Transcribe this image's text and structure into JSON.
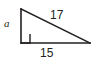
{
  "figure": {
    "type": "right-triangle-diagram",
    "background_color": "#ffffff",
    "stroke_color": "#231f20",
    "labels": {
      "leg_vertical": "a",
      "hypotenuse": "17",
      "base_horizontal": "15"
    },
    "geometry": {
      "apex_top": [
        21,
        9
      ],
      "vertex_right_angle": [
        21,
        43
      ],
      "vertex_right": [
        90,
        43
      ],
      "right_angle_marker_size": 9
    }
  }
}
